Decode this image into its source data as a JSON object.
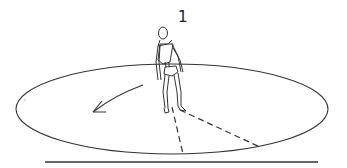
{
  "diagram": {
    "step_label": "1",
    "elements": [
      "ellipse-platform",
      "standing-figure",
      "rotation-arrow",
      "dashed-sightlines",
      "ground-line"
    ],
    "colors": {
      "stroke": "#333333",
      "background": "#ffffff"
    }
  }
}
